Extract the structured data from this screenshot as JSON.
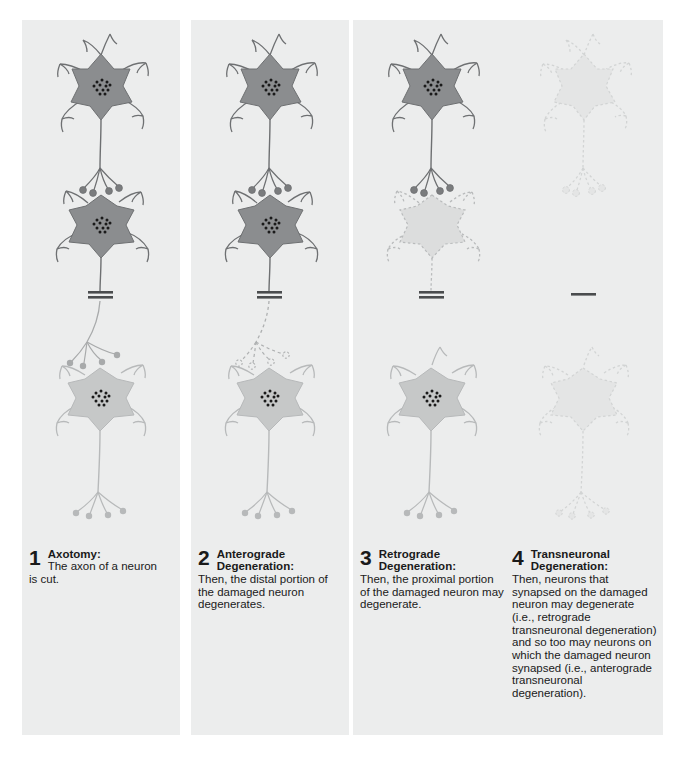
{
  "figure": {
    "background": "#ffffff",
    "panel_background": "#eceded",
    "colors": {
      "healthy_dark_soma": "#8b8d8f",
      "healthy_light_soma": "#c6c8c8",
      "degenerating_soma": "#dcdddd",
      "faint_soma": "#e4e5e5",
      "outline_dark": "#6e7072",
      "outline_light": "#b7b9ba",
      "outline_faint": "#d2d4d4",
      "nucleus_dot": "#1a1a1a",
      "cut_mark": "#4a4c4e",
      "text": "#1a1a1a"
    }
  },
  "panels": [
    {
      "number": "1",
      "heading": "Axotomy:",
      "body": "The axon of a neuron is cut.",
      "body_first": "The axon of a neuron",
      "body_rest": "is cut.",
      "state": {
        "top_neuron": "healthy",
        "middle_neuron": "healthy",
        "bottom_neuron": "healthy",
        "distal_axon": "intact",
        "cut_present": true
      }
    },
    {
      "number": "2",
      "heading": "Anterograde Degeneration:",
      "heading_line1": "Anterograde",
      "heading_line2": "Degeneration:",
      "body": "Then, the distal portion of the damaged neuron degenerates.",
      "state": {
        "top_neuron": "healthy",
        "middle_neuron": "healthy",
        "bottom_neuron": "healthy",
        "distal_axon": "degenerating",
        "cut_present": true
      }
    },
    {
      "number": "3",
      "heading": "Retrograde Degeneration:",
      "heading_line1": "Retrograde",
      "heading_line2": "Degeneration:",
      "body": "Then, the proximal portion of the damaged neuron may degenerate.",
      "state": {
        "top_neuron": "healthy",
        "middle_neuron": "degenerating",
        "bottom_neuron": "healthy",
        "distal_axon": "gone",
        "cut_present": true
      }
    },
    {
      "number": "4",
      "heading": "Transneuronal Degeneration:",
      "heading_line1": "Transneuronal",
      "heading_line2": "Degeneration:",
      "body": "Then, neurons that synapsed on the damaged neuron may degenerate (i.e., retrograde transneuronal degeneration) and so too may neurons on which the damaged neuron synapsed (i.e., anterograde transneuronal degeneration).",
      "state": {
        "top_neuron": "faint",
        "middle_neuron": "gone",
        "bottom_neuron": "faint",
        "distal_axon": "gone",
        "cut_present": true
      }
    }
  ]
}
